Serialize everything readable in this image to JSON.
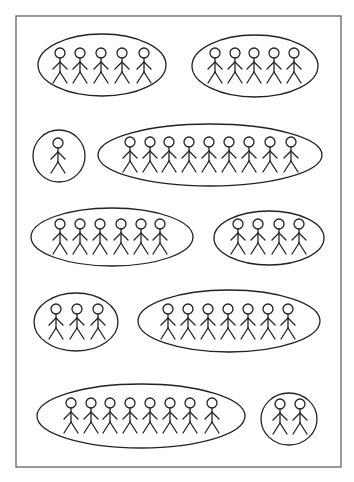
{
  "diagram": {
    "frame": {
      "x": 16,
      "y": 16,
      "width": 325,
      "height": 451
    },
    "stroke_color": "#222222",
    "background": "#ffffff",
    "person_icon": "stick-figure-icon",
    "groups": [
      {
        "id": "group-1",
        "shape": "ellipse",
        "cx": 102,
        "cy": 65,
        "rx": 64,
        "ry": 31,
        "count": 5,
        "heads_x": [
          60,
          80,
          101,
          122,
          144
        ],
        "head_y": 53
      },
      {
        "id": "group-2",
        "shape": "ellipse",
        "cx": 255,
        "cy": 66,
        "rx": 63,
        "ry": 31,
        "count": 5,
        "heads_x": [
          215,
          235,
          254,
          274,
          294
        ],
        "head_y": 53
      },
      {
        "id": "group-3",
        "shape": "circle",
        "cx": 59,
        "cy": 156,
        "rx": 26,
        "ry": 26,
        "count": 1,
        "heads_x": [
          58
        ],
        "head_y": 143
      },
      {
        "id": "group-4",
        "shape": "ellipse",
        "cx": 210,
        "cy": 155,
        "rx": 112,
        "ry": 31,
        "count": 9,
        "heads_x": [
          130,
          150,
          169,
          189,
          209,
          229,
          249,
          270,
          291
        ],
        "head_y": 142
      },
      {
        "id": "group-5",
        "shape": "ellipse",
        "cx": 112,
        "cy": 237,
        "rx": 81,
        "ry": 29,
        "count": 6,
        "heads_x": [
          60,
          80,
          100,
          121,
          141,
          160
        ],
        "head_y": 224
      },
      {
        "id": "group-6",
        "shape": "ellipse",
        "cx": 269,
        "cy": 238,
        "rx": 55,
        "ry": 27,
        "count": 4,
        "heads_x": [
          238,
          258,
          279,
          299
        ],
        "head_y": 224
      },
      {
        "id": "group-7",
        "shape": "ellipse",
        "cx": 76,
        "cy": 322,
        "rx": 42,
        "ry": 29,
        "count": 3,
        "heads_x": [
          56,
          77,
          98
        ],
        "head_y": 309
      },
      {
        "id": "group-8",
        "shape": "ellipse",
        "cx": 229,
        "cy": 321,
        "rx": 91,
        "ry": 31,
        "count": 7,
        "heads_x": [
          168,
          188,
          208,
          228,
          248,
          268,
          288
        ],
        "head_y": 309
      },
      {
        "id": "group-9",
        "shape": "ellipse",
        "cx": 141,
        "cy": 416,
        "rx": 104,
        "ry": 32,
        "count": 8,
        "heads_x": [
          71,
          91,
          110,
          130,
          150,
          170,
          190,
          212
        ],
        "head_y": 403
      },
      {
        "id": "group-10",
        "shape": "circle",
        "cx": 289,
        "cy": 419,
        "rx": 28,
        "ry": 26,
        "count": 2,
        "heads_x": [
          280,
          300
        ],
        "head_y": 404
      }
    ]
  }
}
